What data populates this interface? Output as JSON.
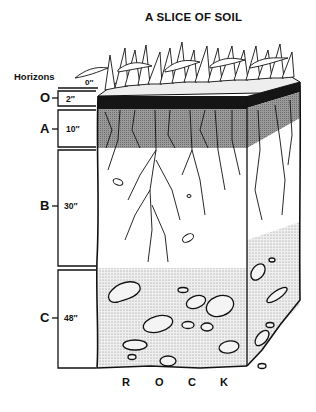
{
  "title": "A SLICE OF SOIL",
  "horizons_label": "Horizons",
  "surface_depth": "0″",
  "horizons": [
    {
      "letter": "O",
      "depth": "2″"
    },
    {
      "letter": "A",
      "depth": "10″"
    },
    {
      "letter": "B",
      "depth": "30″"
    },
    {
      "letter": "C",
      "depth": "48″"
    }
  ],
  "bedrock_letters": [
    "R",
    "O",
    "C",
    "K"
  ],
  "colors": {
    "ink": "#111111",
    "o_horizon": "#151515",
    "a_horizon": "#8a8a8a",
    "c_horizon": "#d4d4d4",
    "paper": "#ffffff"
  }
}
